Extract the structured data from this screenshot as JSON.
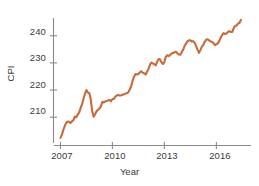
{
  "chart_data": {
    "type": "line",
    "title": "",
    "subtitle": "",
    "xlabel": "Year",
    "ylabel": "CPI",
    "grid": false,
    "legend": null,
    "legend_position": "none",
    "series_color": "#c96a38",
    "axis_color": "#8a8a8a",
    "text_color": "#3b3b3b",
    "xlim": [
      2006.6,
      2018.0
    ],
    "ylim": [
      200.5,
      248.0
    ],
    "xticks": [
      2007,
      2010,
      2013,
      2016
    ],
    "xtick_labels": [
      "2007",
      "2010",
      "2013",
      "2016"
    ],
    "yticks": [
      210,
      220,
      230,
      240
    ],
    "ytick_labels": [
      "210",
      "220",
      "230",
      "240"
    ],
    "series": [
      {
        "name": "CPI",
        "x": [
          2007.0,
          2007.08,
          2007.17,
          2007.25,
          2007.33,
          2007.42,
          2007.5,
          2007.58,
          2007.67,
          2007.75,
          2007.83,
          2007.92,
          2008.0,
          2008.08,
          2008.17,
          2008.25,
          2008.33,
          2008.42,
          2008.5,
          2008.58,
          2008.67,
          2008.75,
          2008.83,
          2008.92,
          2009.0,
          2009.08,
          2009.17,
          2009.25,
          2009.33,
          2009.42,
          2009.5,
          2009.58,
          2009.67,
          2009.75,
          2009.83,
          2009.92,
          2010.0,
          2010.08,
          2010.17,
          2010.25,
          2010.33,
          2010.42,
          2010.5,
          2010.58,
          2010.67,
          2010.75,
          2010.83,
          2010.92,
          2011.0,
          2011.08,
          2011.17,
          2011.25,
          2011.33,
          2011.42,
          2011.5,
          2011.58,
          2011.67,
          2011.75,
          2011.83,
          2011.92,
          2012.0,
          2012.08,
          2012.17,
          2012.25,
          2012.33,
          2012.42,
          2012.5,
          2012.58,
          2012.67,
          2012.75,
          2012.83,
          2012.92,
          2013.0,
          2013.08,
          2013.17,
          2013.25,
          2013.33,
          2013.42,
          2013.5,
          2013.58,
          2013.67,
          2013.75,
          2013.83,
          2013.92,
          2014.0,
          2014.08,
          2014.17,
          2014.25,
          2014.33,
          2014.42,
          2014.5,
          2014.58,
          2014.67,
          2014.75,
          2014.83,
          2014.92,
          2015.0,
          2015.08,
          2015.17,
          2015.25,
          2015.33,
          2015.42,
          2015.5,
          2015.58,
          2015.67,
          2015.75,
          2015.83,
          2015.92,
          2016.0,
          2016.08,
          2016.17,
          2016.25,
          2016.33,
          2016.42,
          2016.5,
          2016.58,
          2016.67,
          2016.75,
          2016.83,
          2016.92,
          2017.0,
          2017.08,
          2017.17,
          2017.25,
          2017.33,
          2017.42
        ],
        "values": [
          202.4,
          203.5,
          205.4,
          206.7,
          207.9,
          208.4,
          208.3,
          207.9,
          208.5,
          208.9,
          210.2,
          210.0,
          211.1,
          211.7,
          213.5,
          214.8,
          216.6,
          218.8,
          220.0,
          219.1,
          218.8,
          216.6,
          212.4,
          210.2,
          211.1,
          212.2,
          212.7,
          213.2,
          213.9,
          215.7,
          215.4,
          215.8,
          216.0,
          216.2,
          216.3,
          215.9,
          216.7,
          216.7,
          217.6,
          218.0,
          218.2,
          218.0,
          218.0,
          218.3,
          218.4,
          218.7,
          218.8,
          219.2,
          220.2,
          221.3,
          223.5,
          224.9,
          225.9,
          225.7,
          225.9,
          226.5,
          226.9,
          226.4,
          226.2,
          225.7,
          226.7,
          227.7,
          229.4,
          230.1,
          229.8,
          229.5,
          229.1,
          230.4,
          231.4,
          231.3,
          230.2,
          229.6,
          230.3,
          232.2,
          232.8,
          232.5,
          232.9,
          233.5,
          233.6,
          233.9,
          234.1,
          233.5,
          233.1,
          233.0,
          233.9,
          234.8,
          236.3,
          237.1,
          237.9,
          238.3,
          238.3,
          237.9,
          238.0,
          237.4,
          236.2,
          234.8,
          233.7,
          234.7,
          236.1,
          236.6,
          237.8,
          238.6,
          238.7,
          238.3,
          237.9,
          237.8,
          237.3,
          236.5,
          236.9,
          237.1,
          238.1,
          239.3,
          240.2,
          241.0,
          240.6,
          240.8,
          241.4,
          241.7,
          241.4,
          241.4,
          242.8,
          243.6,
          243.8,
          244.5,
          244.7,
          245.8
        ]
      }
    ]
  },
  "axis": {
    "ylabel": "CPI",
    "xlabel": "Year",
    "ytick_0": "210",
    "ytick_1": "220",
    "ytick_2": "230",
    "ytick_3": "240",
    "xtick_0": "2007",
    "xtick_1": "2010",
    "xtick_2": "2013",
    "xtick_3": "2016"
  }
}
